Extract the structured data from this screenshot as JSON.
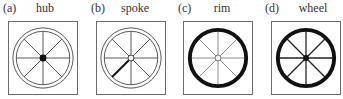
{
  "figure": {
    "panels": [
      {
        "letter": "(a)",
        "title": "hub",
        "highlight": "hub"
      },
      {
        "letter": "(b)",
        "title": "spoke",
        "highlight": "spoke"
      },
      {
        "letter": "(c)",
        "title": "rim",
        "highlight": "rim"
      },
      {
        "letter": "(d)",
        "title": "wheel",
        "highlight": "wheel"
      }
    ],
    "colors": {
      "ink": "#1a1a1a",
      "light_line": "#5a5a5a",
      "faint_line": "#8a8a8a",
      "frame": "#6a6a6a"
    }
  }
}
